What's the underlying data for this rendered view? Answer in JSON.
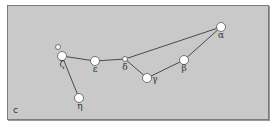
{
  "panel": {
    "label": "c"
  },
  "colors": {
    "background": "#c9c9c9",
    "line": "#4a4a4a",
    "star_fill": "#ffffff",
    "star_stroke": "#555555",
    "label": "#333333"
  },
  "stars": [
    {
      "id": "alpha",
      "label": "α",
      "x": 221,
      "y": 27,
      "r": 4.5,
      "lx": 221,
      "ly": 38
    },
    {
      "id": "beta",
      "label": "β",
      "x": 184,
      "y": 60,
      "r": 4.5,
      "lx": 184,
      "ly": 71
    },
    {
      "id": "gamma",
      "label": "γ",
      "x": 147,
      "y": 78,
      "r": 4.5,
      "lx": 155,
      "ly": 82
    },
    {
      "id": "delta",
      "label": "δ",
      "x": 125,
      "y": 59,
      "r": 2.5,
      "lx": 125,
      "ly": 70
    },
    {
      "id": "epsilon",
      "label": "ε",
      "x": 95,
      "y": 61,
      "r": 4.5,
      "lx": 95,
      "ly": 72
    },
    {
      "id": "zeta",
      "label": "ζ",
      "x": 62,
      "y": 56,
      "r": 4.5,
      "lx": 62,
      "ly": 67
    },
    {
      "id": "eta",
      "label": "η",
      "x": 79,
      "y": 98,
      "r": 4.5,
      "lx": 80,
      "ly": 109
    },
    {
      "id": "companion",
      "label": "",
      "x": 58,
      "y": 47,
      "r": 2.5,
      "lx": 0,
      "ly": 0
    }
  ],
  "lines": [
    [
      "zeta",
      "epsilon"
    ],
    [
      "epsilon",
      "delta"
    ],
    [
      "delta",
      "alpha"
    ],
    [
      "delta",
      "gamma"
    ],
    [
      "gamma",
      "beta"
    ],
    [
      "beta",
      "alpha"
    ],
    [
      "zeta",
      "eta"
    ]
  ]
}
